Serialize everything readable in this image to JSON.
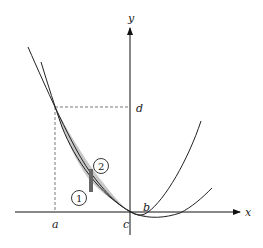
{
  "diagram": {
    "type": "area-between-curves",
    "axes": {
      "x_label": "x",
      "y_label": "y"
    },
    "points": {
      "a": "a",
      "b": "b",
      "c": "c",
      "d": "d"
    },
    "region_markers": [
      {
        "id": "1",
        "label": "1"
      },
      {
        "id": "2",
        "label": "2"
      }
    ],
    "colors": {
      "curve": "#222222",
      "shaded_region": "#c8c8c8",
      "strip": "#666666",
      "dashed": "#555555"
    },
    "curves": [
      {
        "name": "steep-parabola",
        "description": "parabola passing through (a,d) and near origin"
      },
      {
        "name": "flat-parabola",
        "description": "wider parabola passing through (a,d) and b, minimum right of b"
      }
    ]
  }
}
